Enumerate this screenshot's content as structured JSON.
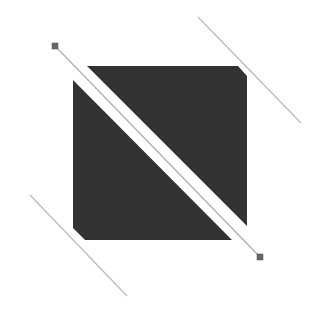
{
  "canvas": {
    "width": 327,
    "height": 322,
    "background": "#ffffff"
  },
  "colors": {
    "fill": "#333333",
    "line": "#bdbdbd",
    "handle_fill": "#666666",
    "handle_stroke": "#555555",
    "divider_line": "#b0b0b0"
  },
  "shapes": {
    "upper_right_triangle": {
      "points": "87,66 238,66 247,76 247,226"
    },
    "lower_left_triangle": {
      "points": "73,80 232,240 85,240 73,228"
    },
    "divider_line": {
      "x1": 55,
      "y1": 46,
      "x2": 260,
      "y2": 257
    },
    "handle_start": {
      "x": 52,
      "y": 43,
      "size": 6
    },
    "handle_end": {
      "x": 257,
      "y": 254,
      "size": 6
    },
    "guide_top_right": {
      "x1": 198,
      "y1": 17,
      "x2": 301,
      "y2": 123
    },
    "guide_bottom_left": {
      "x1": 30,
      "y1": 195,
      "x2": 127,
      "y2": 296
    }
  }
}
